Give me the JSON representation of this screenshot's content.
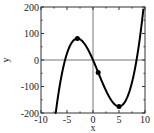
{
  "chart_data": {
    "type": "line",
    "title": "",
    "xlabel": "x",
    "ylabel": "y",
    "xlim": [
      -10,
      10
    ],
    "ylim": [
      -200,
      200
    ],
    "xticks": [
      -10,
      -5,
      0,
      5,
      10
    ],
    "yticks": [
      -200,
      -100,
      0,
      100,
      200
    ],
    "xtick_labels": [
      "-10",
      "-5",
      "0",
      "5",
      "10"
    ],
    "ytick_labels": [
      "-200",
      "-100",
      "0",
      "100",
      "200"
    ],
    "grid": false,
    "zero_lines": true,
    "legend": null,
    "series": [
      {
        "name": "y = x^3 - 3x^2 - 45x",
        "function": "x^3 - 3x^2 - 45x",
        "x": [
          -7.3,
          -7,
          -6,
          -5.37,
          -5,
          -4,
          -3,
          -2,
          -1,
          0,
          1,
          2,
          3,
          4,
          5,
          6,
          7,
          8,
          8.37,
          9,
          9.7
        ],
        "y": [
          -198.4,
          -168,
          -72,
          0,
          35,
          68,
          81,
          70,
          41,
          0,
          -47,
          -94,
          -135,
          -164,
          -175,
          -162,
          -119,
          -40,
          0,
          81,
          196.4
        ],
        "color": "#000000"
      }
    ],
    "markers": [
      {
        "label": "local maximum",
        "x": -3,
        "y": 81
      },
      {
        "label": "inflection point",
        "x": 1,
        "y": -47
      },
      {
        "label": "local minimum",
        "x": 5,
        "y": -175
      }
    ]
  }
}
